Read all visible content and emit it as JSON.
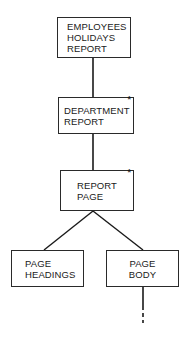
{
  "diagram": {
    "type": "hierarchy-structure-chart",
    "nodes": [
      {
        "id": "employees-holidays-report",
        "lines": [
          "EMPLOYEES",
          "HOLIDAYS",
          "REPORT"
        ],
        "iteration_marker": "",
        "parent": null
      },
      {
        "id": "department-report",
        "lines": [
          "DEPARTMENT",
          "REPORT"
        ],
        "iteration_marker": "*",
        "parent": "employees-holidays-report"
      },
      {
        "id": "report-page",
        "lines": [
          "REPORT",
          "PAGE"
        ],
        "iteration_marker": "*",
        "parent": "department-report"
      },
      {
        "id": "page-headings",
        "lines": [
          "PAGE",
          "HEADINGS"
        ],
        "iteration_marker": "",
        "parent": "report-page"
      },
      {
        "id": "page-body",
        "lines": [
          "PAGE",
          "BODY"
        ],
        "iteration_marker": "",
        "parent": "report-page",
        "continues_below": true
      }
    ],
    "colors": {
      "line": "#1a1a1a",
      "box_border": "#2a2a2a",
      "background": "#ffffff"
    }
  }
}
